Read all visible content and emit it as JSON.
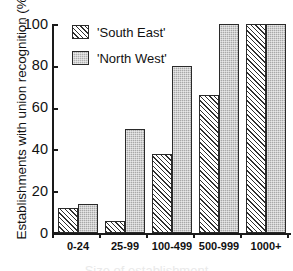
{
  "chart_data": {
    "type": "bar",
    "title": "",
    "xlabel": "Size of establishment",
    "ylabel": "Establishments with union recognition (%)",
    "categories": [
      "0-24",
      "25-99",
      "100-499",
      "500-999",
      "1000+"
    ],
    "series": [
      {
        "name": "'South East'",
        "values": [
          12,
          6,
          38,
          66,
          100
        ],
        "fill": "diagonal-hatch"
      },
      {
        "name": "'North West'",
        "values": [
          14,
          50,
          80,
          100,
          100
        ],
        "fill": "solid-gray"
      }
    ],
    "ylim": [
      0,
      100
    ],
    "yticks": [
      0,
      20,
      40,
      60,
      80,
      100
    ],
    "ytick_labels": [
      "0",
      "20",
      "40",
      "60",
      "80",
      "100"
    ],
    "grid": false,
    "legend_position": "top-left",
    "colors": {
      "south_east": "#d6d6d6",
      "north_west": "#a8a8a8",
      "axis": "#1a1a1a",
      "background": "#ffffff"
    }
  },
  "axis": {
    "y_title": "Establishments with union recognition (%)",
    "x_title_cropped": "Size of establishment"
  },
  "legend": {
    "entries": [
      {
        "label": "'South East'"
      },
      {
        "label": "'North West'"
      }
    ]
  }
}
